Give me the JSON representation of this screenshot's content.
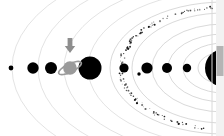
{
  "canvas": {
    "width": 224,
    "height": 136,
    "background": "#ffffff",
    "title": "Solar System Orbital Diagram"
  },
  "palette": {
    "orbit_stroke": "#bfbfbf",
    "orbit_stroke_faint": "#cccccc",
    "planet_fill": "#000000",
    "ring_fill": "#9a9a9a",
    "asteroid_fill": "#111111",
    "cursor_fill": "#8e8e8e",
    "edge_line": "#d8d8d8",
    "scroll_thumb": "#b4b4b4"
  },
  "sun": {
    "name": "sun",
    "cx": 224,
    "cy": 68,
    "r": 19,
    "color": "#000000"
  },
  "orbits": [
    {
      "name": "orbit-1",
      "rx": 26,
      "ry": 16,
      "faint": false
    },
    {
      "name": "orbit-2",
      "rx": 41,
      "ry": 25,
      "faint": false
    },
    {
      "name": "orbit-3",
      "rx": 56,
      "ry": 34,
      "faint": false
    },
    {
      "name": "orbit-4",
      "rx": 72,
      "ry": 44,
      "faint": false
    },
    {
      "name": "orbit-5",
      "rx": 92,
      "ry": 55,
      "faint": false
    },
    {
      "name": "orbit-6",
      "rx": 114,
      "ry": 66,
      "faint": false
    },
    {
      "name": "orbit-7",
      "rx": 136,
      "ry": 77,
      "faint": true
    },
    {
      "name": "orbit-8",
      "rx": 160,
      "ry": 88,
      "faint": true
    },
    {
      "name": "orbit-9",
      "rx": 186,
      "ry": 100,
      "faint": true
    },
    {
      "name": "orbit-10",
      "rx": 212,
      "ry": 112,
      "faint": true
    }
  ],
  "asteroid_belt": {
    "name": "asteroid-belt",
    "label": "asteroid belt",
    "rx": 103,
    "ry": 61,
    "band_width": 5,
    "dot_count": 260,
    "color": "#111111"
  },
  "planets": [
    {
      "name": "planet-mercury",
      "label": "Mercury",
      "cx": 187,
      "cy": 68,
      "r": 4.2,
      "ringed": false
    },
    {
      "name": "planet-venus",
      "label": "Venus",
      "cx": 167,
      "cy": 68,
      "r": 5.0,
      "ringed": false
    },
    {
      "name": "planet-earth",
      "label": "Earth",
      "cx": 147,
      "cy": 68,
      "r": 5.6,
      "ringed": false,
      "moon": {
        "name": "moon",
        "cx": 139,
        "cy": 74,
        "r": 1.7
      }
    },
    {
      "name": "planet-mars",
      "label": "Mars",
      "cx": 124,
      "cy": 68,
      "r": 4.6,
      "ringed": false
    },
    {
      "name": "planet-jupiter",
      "label": "Jupiter",
      "cx": 90,
      "cy": 68,
      "r": 11.5,
      "ringed": false
    },
    {
      "name": "planet-saturn",
      "label": "Saturn",
      "cx": 70,
      "cy": 68,
      "r": 6.8,
      "ringed": true,
      "ring_rx": 12.5,
      "ring_ry": 4.2,
      "ring_tilt": -26
    },
    {
      "name": "planet-uranus",
      "label": "Uranus",
      "cx": 51,
      "cy": 68,
      "r": 6.0,
      "ringed": false
    },
    {
      "name": "planet-neptune",
      "label": "Neptune",
      "cx": 33,
      "cy": 68,
      "r": 5.7,
      "ringed": false
    },
    {
      "name": "planet-pluto",
      "label": "Pluto",
      "cx": 11,
      "cy": 68,
      "r": 2.4,
      "ringed": false
    }
  ],
  "cursor": {
    "name": "mouse-cursor",
    "x": 70,
    "y": 48,
    "color": "#8e8e8e",
    "points_at": "planet-saturn"
  },
  "window_edge": {
    "name": "window-right-edge",
    "x": 212,
    "scrollbar_x": 216,
    "scrollbar_thumb_top": 46,
    "scrollbar_thumb_height": 30
  }
}
